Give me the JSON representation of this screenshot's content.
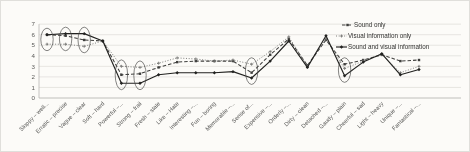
{
  "chart_data": {
    "type": "line",
    "title": "",
    "xlabel": "",
    "ylabel": "",
    "ylim": [
      0,
      7
    ],
    "yticks": [
      0,
      1,
      2,
      3,
      4,
      5,
      6,
      7
    ],
    "grid": true,
    "legend_position": "right-top",
    "categories": [
      "Sloppy – well...",
      "Erratic – precise",
      "Vague – clear",
      "Soft – hard",
      "Powerful –...",
      "Strong – frail",
      "Fresh – stale",
      "Like – Hate",
      "Interesting –...",
      "Fun – boring",
      "Memorable –...",
      "Sense of...",
      "Expensive –...",
      "Orderly –...",
      "Dirty – clean",
      "Detached –...",
      "Gaudy – plain",
      "Cheerful – sad",
      "Light – heavy",
      "Unique –...",
      "Fantastical –..."
    ],
    "series": [
      {
        "name": "Sound only",
        "line_style": "dashed",
        "marker": "square",
        "color": "#3f3f3d",
        "values": [
          6.0,
          5.9,
          5.5,
          5.4,
          2.2,
          2.3,
          2.9,
          3.4,
          3.5,
          3.5,
          3.5,
          2.4,
          4.1,
          5.6,
          3.1,
          5.5,
          3.2,
          3.6,
          4.1,
          3.5,
          3.6
        ]
      },
      {
        "name": "Visual information only",
        "line_style": "dotted",
        "marker": "plus",
        "color": "#737371",
        "values": [
          5.1,
          5.1,
          4.9,
          5.4,
          3.0,
          2.9,
          3.3,
          3.8,
          3.7,
          3.5,
          3.6,
          3.2,
          4.4,
          5.8,
          3.0,
          5.6,
          2.8,
          3.5,
          4.1,
          2.4,
          3.0
        ]
      },
      {
        "name": "Sound and visual information",
        "line_style": "solid",
        "marker": "diamond",
        "color": "#222220",
        "values": [
          6.0,
          6.1,
          6.1,
          5.4,
          1.4,
          1.4,
          2.2,
          2.4,
          2.4,
          2.4,
          2.5,
          1.9,
          3.5,
          5.4,
          2.9,
          5.9,
          2.1,
          3.4,
          4.2,
          2.2,
          2.7
        ]
      }
    ],
    "annotations": {
      "ellipse_categories": [
        1,
        2,
        3,
        5,
        6,
        12,
        17
      ],
      "note": "hand-drawn ellipses circling point clusters"
    }
  },
  "colors": {
    "grid": "#dbdad6",
    "axis": "#b9b8b4",
    "tick_text": "#5a5a58",
    "annotation": "#4a4a48",
    "background": "#fcfbf8",
    "border": "#e0dfdb"
  }
}
